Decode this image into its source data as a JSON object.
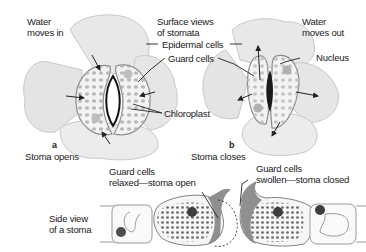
{
  "diagram": {
    "panel_a": {
      "letter": "a",
      "caption": "Stoma opens",
      "water_label_line1": "Water",
      "water_label_line2": "moves in"
    },
    "panel_b": {
      "letter": "b",
      "caption": "Stoma closes",
      "water_label_line1": "Water",
      "water_label_line2": "moves out",
      "nucleus_label": "Nucleus"
    },
    "shared_labels": {
      "surface_views_line1": "Surface views",
      "surface_views_line2": "of stomata",
      "epidermal_cells": "Epidermal cells",
      "guard_cells": "Guard cells",
      "chloroplast": "Chloroplast"
    },
    "side_view": {
      "title_line1": "Side view",
      "title_line2": "of a stoma",
      "open_label_line1": "Guard cells",
      "open_label_line2": "relaxed—stoma open",
      "closed_label_line1": "Guard cells",
      "closed_label_line2": "swollen—stoma closed"
    },
    "colors": {
      "epidermal_fill": "#e6e6e6",
      "guard_fill": "#f2f2f2",
      "chloroplast": "#a6a6a6",
      "nucleus": "#4d4d4d",
      "outline": "#8a8a8a"
    }
  }
}
